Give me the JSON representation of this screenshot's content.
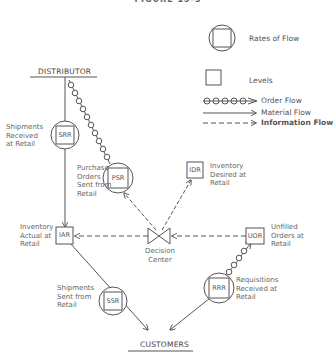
{
  "title": "FIGURE 15-3",
  "legend": {
    "rates": "Rates of Flow",
    "levels": "Levels",
    "order_flow": "Order Flow",
    "material_flow": "Material Flow",
    "information_flow": "Information Flow"
  },
  "endpoints": {
    "source": "DISTRIBUTOR",
    "sink": "CUSTOMERS"
  },
  "nodes": {
    "srr": {
      "code": "SRR",
      "label_lines": [
        "Shipments",
        "Received",
        "at Retail"
      ],
      "type": "rate"
    },
    "psr": {
      "code": "PSR",
      "label_lines": [
        "Purchase",
        "Orders",
        "Sent from",
        "Retail"
      ],
      "type": "rate"
    },
    "idr": {
      "code": "IDR",
      "label_lines": [
        "Inventory",
        "Desired at",
        "Retail"
      ],
      "type": "level"
    },
    "iar": {
      "code": "IAR",
      "label_lines": [
        "Inventory",
        "Actual at",
        "Retail"
      ],
      "type": "level"
    },
    "uor": {
      "code": "UOR",
      "label_lines": [
        "Unfilled",
        "Orders at",
        "Retail"
      ],
      "type": "level"
    },
    "ssr": {
      "code": "SSR",
      "label_lines": [
        "Shipments",
        "Sent from",
        "Retail"
      ],
      "type": "rate"
    },
    "rrr": {
      "code": "RRR",
      "label_lines": [
        "Requisitions",
        "Received at",
        "Retail"
      ],
      "type": "rate"
    },
    "decision": {
      "label_lines": [
        "Decision",
        "Center"
      ]
    }
  }
}
